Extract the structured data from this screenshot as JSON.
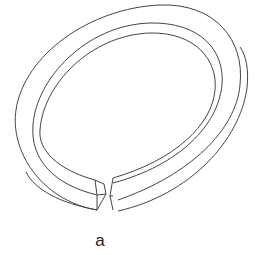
{
  "figure": {
    "label": "a",
    "stroke_color": "#444444",
    "background": "#ffffff"
  }
}
